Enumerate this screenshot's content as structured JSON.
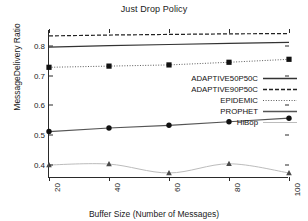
{
  "chart_data": {
    "type": "line",
    "title": "Just Drop Policy",
    "xlabel": "Buffer Size (Number of Messages)",
    "ylabel": "MessageDelivery Ratio",
    "x": [
      20,
      40,
      60,
      80,
      100
    ],
    "xticklabels": [
      "20",
      "40",
      "60",
      "80",
      "100"
    ],
    "yticklabels": [
      "0.4",
      "0.5",
      "0.6",
      "0.7",
      "0.8"
    ],
    "yticks": [
      0.4,
      0.5,
      0.6,
      0.7,
      0.8
    ],
    "xlim": [
      20,
      100
    ],
    "ylim": [
      0.355,
      0.855
    ],
    "grid": false,
    "legend_position": "center-right",
    "series": [
      {
        "name": "ADAPTIVE50P50C",
        "values": [
          0.797,
          0.802,
          0.806,
          0.81,
          0.813
        ],
        "style": "solid",
        "marker": "none",
        "color": "#333333"
      },
      {
        "name": "ADAPTIVE90P50C",
        "values": [
          0.835,
          0.838,
          0.84,
          0.842,
          0.843
        ],
        "style": "dashed",
        "marker": "none",
        "color": "#222222"
      },
      {
        "name": "EPIDEMIC",
        "values": [
          0.729,
          0.733,
          0.737,
          0.746,
          0.756
        ],
        "style": "dotted",
        "marker": "square",
        "color": "#4a4a4a"
      },
      {
        "name": "PROPHET",
        "values": [
          0.512,
          0.524,
          0.533,
          0.545,
          0.557
        ],
        "style": "solid",
        "marker": "circle",
        "color": "#555555"
      },
      {
        "name": "HiBop",
        "values": [
          0.399,
          0.402,
          0.372,
          0.403,
          0.372
        ],
        "style": "solid",
        "marker": "triangle",
        "color": "#bcbcbc"
      }
    ]
  },
  "legend": {
    "items": [
      {
        "label": "ADAPTIVE50P50C"
      },
      {
        "label": "ADAPTIVE90P50C"
      },
      {
        "label": "EPIDEMIC"
      },
      {
        "label": "PROPHET"
      },
      {
        "label": "HiBop"
      }
    ]
  }
}
